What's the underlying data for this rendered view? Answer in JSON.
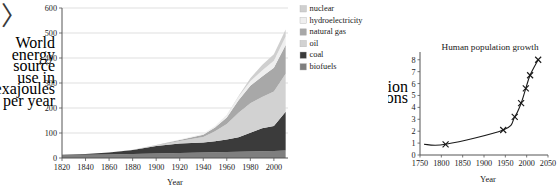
{
  "page": {
    "background": "#ffffff",
    "marker_glyph": "〉"
  },
  "chart_data": [
    {
      "id": "world-energy",
      "type": "area",
      "stacked": true,
      "title": "",
      "xlabel": "Year",
      "ylabel": "World energy source use in exajoules per year",
      "ylabel_lines": [
        "World",
        "energy",
        "source",
        "use in",
        "exajoules",
        "per year"
      ],
      "xlim": [
        1820,
        2012
      ],
      "ylim": [
        0,
        600
      ],
      "xticks": [
        1820,
        1840,
        1860,
        1880,
        1900,
        1920,
        1940,
        1960,
        1980,
        2000
      ],
      "yticks": [
        0,
        100,
        200,
        300,
        400,
        500,
        600
      ],
      "grid": true,
      "legend_position": "right",
      "x": [
        1820,
        1840,
        1860,
        1880,
        1900,
        1920,
        1940,
        1950,
        1960,
        1970,
        1980,
        1990,
        2000,
        2010
      ],
      "series": [
        {
          "name": "biofuels",
          "color": "#7f7f7f",
          "values": [
            12,
            13,
            14,
            16,
            18,
            20,
            22,
            23,
            24,
            25,
            26,
            27,
            28,
            30
          ]
        },
        {
          "name": "coal",
          "color": "#3b3b3b",
          "values": [
            1,
            3,
            8,
            16,
            30,
            38,
            40,
            44,
            50,
            58,
            75,
            92,
            100,
            155
          ]
        },
        {
          "name": "oil",
          "color": "#d2d2d2",
          "values": [
            0,
            0,
            0,
            1,
            3,
            10,
            22,
            40,
            62,
            98,
            118,
            125,
            138,
            152
          ]
        },
        {
          "name": "natural gas",
          "color": "#a8a8a8",
          "values": [
            0,
            0,
            0,
            0,
            1,
            4,
            9,
            15,
            26,
            50,
            70,
            82,
            95,
            115
          ]
        },
        {
          "name": "hydroelectricity",
          "color": "#efefef",
          "values": [
            0,
            0,
            0,
            0,
            0,
            2,
            4,
            6,
            9,
            14,
            18,
            24,
            28,
            34
          ]
        },
        {
          "name": "nuclear",
          "color": "#cfcfcf",
          "values": [
            0,
            0,
            0,
            0,
            0,
            0,
            0,
            0,
            1,
            3,
            12,
            22,
            26,
            28
          ]
        }
      ],
      "legend": [
        {
          "label": "nuclear",
          "color": "#cfcfcf"
        },
        {
          "label": "hydroelectricity",
          "color": "#efefef"
        },
        {
          "label": "natural gas",
          "color": "#a8a8a8"
        },
        {
          "label": "oil",
          "color": "#d2d2d2"
        },
        {
          "label": "coal",
          "color": "#3b3b3b"
        },
        {
          "label": "biofuels",
          "color": "#7f7f7f"
        }
      ]
    },
    {
      "id": "human-population",
      "type": "line",
      "title": "Human population growth",
      "xlabel": "Year",
      "ylabel": "Population in billions",
      "ylabel_lines": [
        "Population",
        "in billions"
      ],
      "xlim": [
        1750,
        2050
      ],
      "ylim": [
        0,
        8.4
      ],
      "xticks": [
        1750,
        1800,
        1850,
        1900,
        1950,
        2000,
        2050
      ],
      "yticks": [
        0,
        1,
        2,
        3,
        4,
        5,
        6,
        7,
        8
      ],
      "grid": false,
      "marker": "x",
      "points": [
        {
          "x": 1810,
          "y": 0.9
        },
        {
          "x": 1945,
          "y": 2.1
        },
        {
          "x": 1972,
          "y": 3.2
        },
        {
          "x": 1987,
          "y": 4.35
        },
        {
          "x": 1998,
          "y": 5.6
        },
        {
          "x": 2008,
          "y": 6.7
        },
        {
          "x": 2027,
          "y": 8.0
        }
      ]
    }
  ]
}
